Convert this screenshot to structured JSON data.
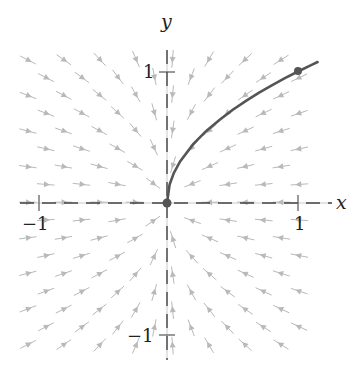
{
  "chart_data": {
    "type": "line",
    "title": "",
    "subtitle": "Direction (slope) field with solution curve y = sqrt(x)",
    "xlabel": "x",
    "ylabel": "y",
    "xlim": [
      -1.05,
      1.15
    ],
    "ylim": [
      -1.2,
      1.2
    ],
    "grid": false,
    "legend": null,
    "x_ticks": [
      {
        "value": -1,
        "label": "−1"
      },
      {
        "value": 1,
        "label": "1"
      }
    ],
    "y_ticks": [
      {
        "value": 1,
        "label": "1"
      },
      {
        "value": -1,
        "label": "−1"
      }
    ],
    "slope_field": {
      "description": "arrows point toward origin along direction (-2x, -y); slope dy/dx = y/(2x)",
      "color": "#b9b9b9",
      "layout": "staggered grid"
    },
    "series": [
      {
        "name": "solution curve",
        "color": "#555555",
        "x": [
          0,
          0.02,
          0.05,
          0.1,
          0.2,
          0.3,
          0.4,
          0.5,
          0.6,
          0.7,
          0.8,
          0.9,
          1.0,
          1.1,
          1.15
        ],
        "y": [
          0,
          0.141,
          0.224,
          0.316,
          0.447,
          0.548,
          0.632,
          0.707,
          0.775,
          0.837,
          0.894,
          0.949,
          1.0,
          1.049,
          1.072
        ]
      }
    ],
    "points": [
      {
        "x": 0,
        "y": 0,
        "label": "origin"
      },
      {
        "x": 1,
        "y": 1,
        "label": "(1, 1)"
      }
    ]
  },
  "labels": {
    "x_axis": "x",
    "y_axis": "y",
    "x_tick_neg": "−1",
    "x_tick_pos": "1",
    "y_tick_pos": "1",
    "y_tick_neg": "−1"
  }
}
